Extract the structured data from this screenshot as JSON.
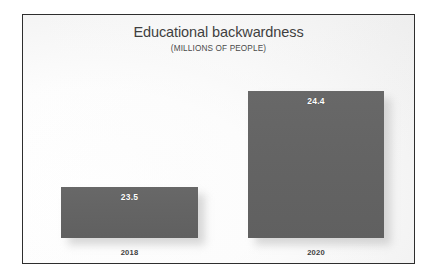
{
  "chart_data": {
    "type": "bar",
    "title": "Educational backwardness",
    "subtitle": "(MILLIONS OF PEOPLE)",
    "xlabel": "",
    "ylabel": "",
    "unit": "millions of people",
    "categories": [
      "2018",
      "2020"
    ],
    "values": [
      23.5,
      24.4
    ],
    "value_labels": [
      "23.5",
      "24.4"
    ],
    "series": [
      {
        "name": "Educational backwardness",
        "values": [
          23.5,
          24.4
        ]
      }
    ],
    "grid": false,
    "legend": "none",
    "axis_visible": false,
    "bar_color": "#646464",
    "label_color": "#ffffff",
    "title_color": "#3f3f3f",
    "background_color": "#fdfdfd",
    "border_color": "#2e2e2e"
  },
  "chart": {
    "title": "Educational backwardness",
    "subtitle": "(MILLIONS OF PEOPLE)",
    "bars": [
      {
        "category": "2018",
        "label": "23.5"
      },
      {
        "category": "2020",
        "label": "24.4"
      }
    ]
  }
}
